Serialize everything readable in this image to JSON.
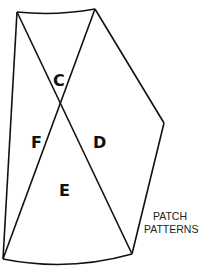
{
  "diagram": {
    "caption": [
      "PATCH",
      "PATTERNS"
    ],
    "patches": [
      {
        "id": "C",
        "label": "C"
      },
      {
        "id": "D",
        "label": "D"
      },
      {
        "id": "E",
        "label": "E"
      },
      {
        "id": "F",
        "label": "F"
      }
    ],
    "colors": {
      "stroke": "#111111",
      "background": "#ffffff"
    }
  }
}
